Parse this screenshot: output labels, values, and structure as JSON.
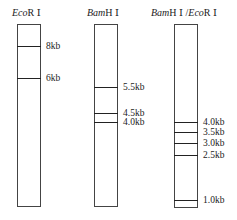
{
  "figure": {
    "lanes": [
      {
        "title_italic": "Eco",
        "title_rest": "R Ⅰ",
        "x": 17,
        "width": 24,
        "top": 24,
        "bottom": 207,
        "title_x": 12,
        "bands": [
          {
            "label": "8kb",
            "y": 46
          },
          {
            "label": "6kb",
            "y": 78
          }
        ]
      },
      {
        "title_italic": "Bam",
        "title_rest": "H Ⅰ",
        "x": 94,
        "width": 24,
        "top": 24,
        "bottom": 207,
        "title_x": 87,
        "bands": [
          {
            "label": "5.5kb",
            "y": 87
          },
          {
            "label": "4.5kb",
            "y": 113
          },
          {
            "label": "4.0kb",
            "y": 122
          }
        ]
      },
      {
        "title_italic": "Bam",
        "title_rest": "H Ⅰ /",
        "title_italic2": "Eco",
        "title_rest2": "R Ⅰ",
        "x": 174,
        "width": 24,
        "top": 24,
        "bottom": 208,
        "title_x": 151,
        "bands": [
          {
            "label": "4.0kb",
            "y": 122
          },
          {
            "label": "3.5kb",
            "y": 132
          },
          {
            "label": "3.0kb",
            "y": 143
          },
          {
            "label": "2.5kb",
            "y": 155
          },
          {
            "label": "1.0kb",
            "y": 200
          }
        ]
      }
    ]
  }
}
